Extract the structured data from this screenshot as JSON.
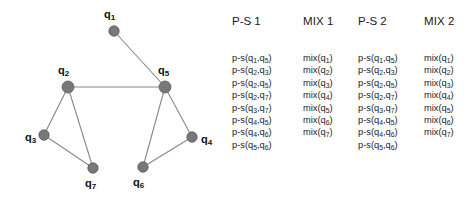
{
  "figure": {
    "background_color": "#ffffff",
    "node_color": "#787878",
    "node_stroke_color": "#5a5a5a",
    "edge_color": "#888888",
    "text_color": "#1a1a1a"
  },
  "graph": {
    "nodes": [
      {
        "id": "q1",
        "label": "q",
        "sub": "1",
        "cx": 114,
        "cy": 31,
        "r": 5.2,
        "label_x": 104,
        "label_y": 9,
        "label_align": "above"
      },
      {
        "id": "q2",
        "label": "q",
        "sub": "2",
        "cx": 68,
        "cy": 87,
        "r": 6.0,
        "label_x": 58,
        "label_y": 65,
        "label_align": "above"
      },
      {
        "id": "q3",
        "label": "q",
        "sub": "3",
        "cx": 44,
        "cy": 135,
        "r": 5.2,
        "label_x": 25,
        "label_y": 132,
        "label_align": "left"
      },
      {
        "id": "q4",
        "label": "q",
        "sub": "4",
        "cx": 192,
        "cy": 137,
        "r": 5.2,
        "label_x": 201,
        "label_y": 134,
        "label_align": "right"
      },
      {
        "id": "q5",
        "label": "q",
        "sub": "5",
        "cx": 165,
        "cy": 87,
        "r": 6.0,
        "label_x": 158,
        "label_y": 65,
        "label_align": "above"
      },
      {
        "id": "q6",
        "label": "q",
        "sub": "6",
        "cx": 143,
        "cy": 167,
        "r": 5.2,
        "label_x": 133,
        "label_y": 177,
        "label_align": "below"
      },
      {
        "id": "q7",
        "label": "q",
        "sub": "7",
        "cx": 93,
        "cy": 168,
        "r": 5.2,
        "label_x": 85,
        "label_y": 178,
        "label_align": "below"
      }
    ],
    "edges": [
      {
        "from": "q1",
        "to": "q5"
      },
      {
        "from": "q2",
        "to": "q5"
      },
      {
        "from": "q2",
        "to": "q3"
      },
      {
        "from": "q2",
        "to": "q7"
      },
      {
        "from": "q3",
        "to": "q7"
      },
      {
        "from": "q5",
        "to": "q4"
      },
      {
        "from": "q5",
        "to": "q6"
      },
      {
        "from": "q4",
        "to": "q6"
      }
    ]
  },
  "table": {
    "columns": [
      {
        "key": "ps1",
        "header": "P-S 1",
        "rows": [
          {
            "fn": "p-s",
            "a": "1",
            "b": "5"
          },
          {
            "fn": "p-s",
            "a": "2",
            "b": "3"
          },
          {
            "fn": "p-s",
            "a": "2",
            "b": "5"
          },
          {
            "fn": "p-s",
            "a": "2",
            "b": "7"
          },
          {
            "fn": "p-s",
            "a": "3",
            "b": "7"
          },
          {
            "fn": "p-s",
            "a": "4",
            "b": "5"
          },
          {
            "fn": "p-s",
            "a": "4",
            "b": "6"
          },
          {
            "fn": "p-s",
            "a": "5",
            "b": "6"
          }
        ]
      },
      {
        "key": "mix1",
        "header": "MIX 1",
        "rows": [
          {
            "fn": "mix",
            "a": "1"
          },
          {
            "fn": "mix",
            "a": "2"
          },
          {
            "fn": "mix",
            "a": "3"
          },
          {
            "fn": "mix",
            "a": "4"
          },
          {
            "fn": "mix",
            "a": "5"
          },
          {
            "fn": "mix",
            "a": "6"
          },
          {
            "fn": "mix",
            "a": "7"
          }
        ]
      },
      {
        "key": "ps2",
        "header": "P-S 2",
        "rows": [
          {
            "fn": "p-s",
            "a": "1",
            "b": "5"
          },
          {
            "fn": "p-s",
            "a": "2",
            "b": "3"
          },
          {
            "fn": "p-s",
            "a": "2",
            "b": "5"
          },
          {
            "fn": "p-s",
            "a": "2",
            "b": "7"
          },
          {
            "fn": "p-s",
            "a": "3",
            "b": "7"
          },
          {
            "fn": "p-s",
            "a": "4",
            "b": "5"
          },
          {
            "fn": "p-s",
            "a": "4",
            "b": "6"
          },
          {
            "fn": "p-s",
            "a": "5",
            "b": "6"
          }
        ]
      },
      {
        "key": "mix2",
        "header": "MIX 2",
        "rows": [
          {
            "fn": "mix",
            "a": "1"
          },
          {
            "fn": "mix",
            "a": "2"
          },
          {
            "fn": "mix",
            "a": "3"
          },
          {
            "fn": "mix",
            "a": "4"
          },
          {
            "fn": "mix",
            "a": "5"
          },
          {
            "fn": "mix",
            "a": "6"
          },
          {
            "fn": "mix",
            "a": "7"
          }
        ]
      }
    ]
  }
}
